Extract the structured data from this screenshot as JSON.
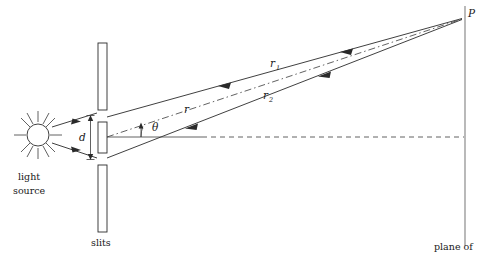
{
  "figure": {
    "background_color": "#ffffff",
    "line_color": "#2a2a2a",
    "screen_color": "#808080"
  },
  "labels": {
    "light_source_line1": "light",
    "light_source_line2": "source",
    "slits": "slits",
    "slit_separation": "d",
    "angle": "θ",
    "ray_top": "r",
    "ray_top_sub": "1",
    "ray_bottom": "r",
    "ray_bottom_sub": "2",
    "ray_center": "r",
    "point_p": "P",
    "plane_of": "plane of"
  },
  "geometry": {
    "source_center_x": 38,
    "source_center_y": 135,
    "source_radius": 11,
    "slit_bar_top": {
      "x": 98,
      "y": 43,
      "w": 9,
      "h": 67
    },
    "slit_bar_mid": {
      "x": 98,
      "y": 122,
      "w": 9,
      "h": 31
    },
    "slit_bar_bottom": {
      "x": 98,
      "y": 165,
      "w": 9,
      "h": 67
    },
    "point_p_x": 464,
    "point_p_y": 17,
    "screen_x": 465,
    "screen_top_y": 6,
    "screen_bottom_y": 246,
    "axis_y": 137,
    "theta_degrees": 14
  },
  "elements": {
    "sun_ray_count": 12,
    "arrowheads_on_rays": 3
  }
}
